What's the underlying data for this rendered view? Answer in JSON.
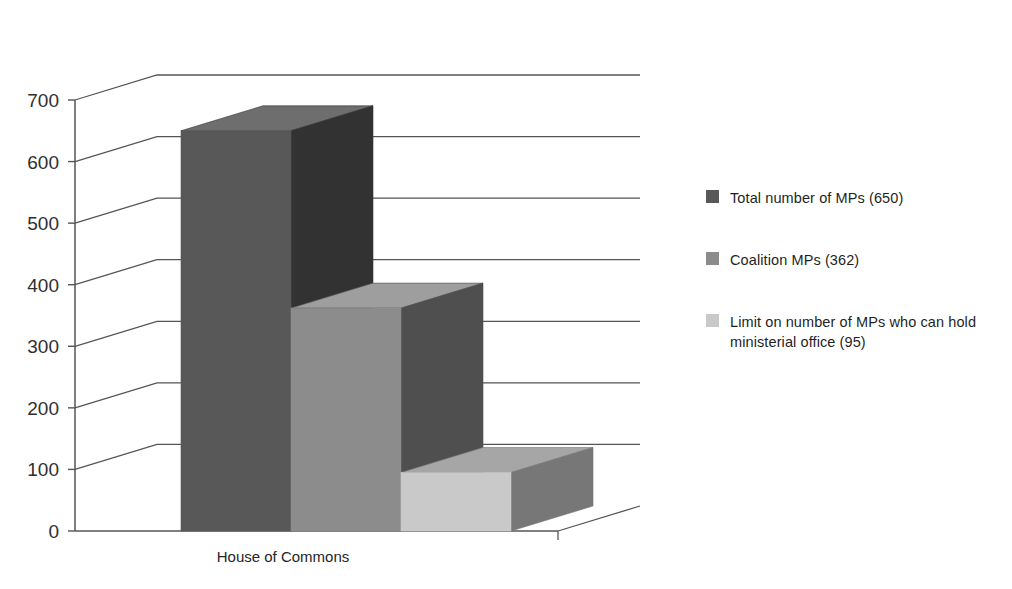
{
  "chart_data": {
    "type": "bar",
    "title": "",
    "subtitle": "",
    "xlabel": "",
    "ylabel": "",
    "categories": [
      "House of Commons"
    ],
    "ylim": [
      0,
      700
    ],
    "ytick_labels": [
      "0",
      "100",
      "200",
      "300",
      "400",
      "500",
      "600",
      "700"
    ],
    "ytick_values": [
      0,
      100,
      200,
      300,
      400,
      500,
      600,
      700
    ],
    "grid": true,
    "three_d": true,
    "legend_position": "right",
    "series": [
      {
        "name": "Total number of MPs (650)",
        "short_name": "Total number of MPs",
        "values": [
          650
        ],
        "value": 650,
        "color": "#585858",
        "color_top": "#6e6e6e",
        "color_side": "#323232"
      },
      {
        "name": "Coalition MPs (362)",
        "short_name": "Coalition MPs",
        "values": [
          362
        ],
        "value": 362,
        "color": "#8c8c8c",
        "color_top": "#9e9e9e",
        "color_side": "#4f4f4f"
      },
      {
        "name": "Limit on number of MPs who can hold ministerial office (95)",
        "short_name": "Limit on number of MPs who can hold ministerial office",
        "values": [
          95
        ],
        "value": 95,
        "color": "#c9c9c9",
        "color_top": "#a6a6a6",
        "color_side": "#777777"
      }
    ]
  },
  "axis": {
    "ticks": [
      {
        "label": "700",
        "value": 700
      },
      {
        "label": "600",
        "value": 600
      },
      {
        "label": "500",
        "value": 500
      },
      {
        "label": "400",
        "value": 400
      },
      {
        "label": "300",
        "value": 300
      },
      {
        "label": "200",
        "value": 200
      },
      {
        "label": "100",
        "value": 100
      },
      {
        "label": "0",
        "value": 0
      }
    ],
    "category_label": "House of Commons"
  },
  "legend": {
    "entries": [
      {
        "label": "Total number of MPs (650)",
        "color": "#585858"
      },
      {
        "label": "Coalition MPs (362)",
        "color": "#8c8c8c"
      },
      {
        "label": "Limit on number of MPs who can hold ministerial office (95)",
        "color": "#c9c9c9"
      }
    ]
  },
  "colors": {
    "axis_line": "#555555",
    "grid_line": "#555555",
    "background": "#ffffff",
    "text": "#1f1f1f"
  }
}
